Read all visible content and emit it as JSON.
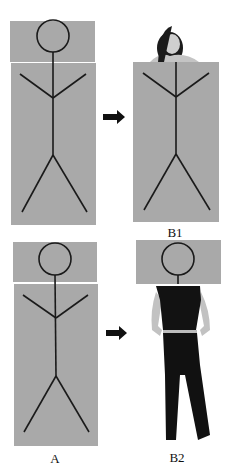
{
  "diagram": {
    "colors": {
      "panel": "#a9a9a9",
      "stroke": "#1a1a1a",
      "separator": "#f2f2f2",
      "clothing": "#111111",
      "skin": "#c8c8c8"
    },
    "panels": [
      {
        "id": "A_top",
        "description": "Stick figure in gray head box and body box",
        "label": ""
      },
      {
        "id": "B1",
        "description": "Photo head of woman above stick-figure body box",
        "label": "B1"
      },
      {
        "id": "A_bottom",
        "description": "Stick figure in gray head box and body box",
        "label": "A"
      },
      {
        "id": "B2",
        "description": "Stick-figure head box above photo body of woman",
        "label": "B2"
      }
    ],
    "arrows": [
      {
        "from": "A_top",
        "to": "B1",
        "icon": "right-arrow-icon"
      },
      {
        "from": "A_bottom",
        "to": "B2",
        "icon": "right-arrow-icon"
      }
    ],
    "labels": {
      "a": "A",
      "b1": "B1",
      "b2": "B2"
    }
  }
}
